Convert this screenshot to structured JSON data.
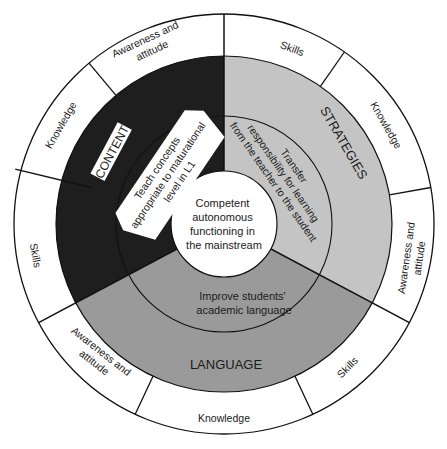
{
  "diagram": {
    "center": {
      "label_lines": [
        "Competent",
        "autonomous",
        "functioning in",
        "the mainstream"
      ]
    },
    "sectors": [
      {
        "id": "content",
        "title": "CONTENT",
        "fill": "#1e1e1e",
        "goal_lines": [
          "Teach concepts",
          "appropriate to maturational",
          "level in L1"
        ],
        "outer_ring": [
          "Awareness and attitude",
          "Knowledge",
          "Skills"
        ]
      },
      {
        "id": "strategies",
        "title": "STRATEGIES",
        "fill": "#c4c4c4",
        "goal_lines": [
          "Transfer",
          "responsibility for learning",
          "from the teacher to the student"
        ],
        "outer_ring": [
          "Skills",
          "Knowledge",
          "Awareness and attitude"
        ]
      },
      {
        "id": "language",
        "title": "LANGUAGE",
        "fill": "#9a9a9a",
        "goal_lines": [
          "Improve students'",
          "academic language"
        ],
        "outer_ring": [
          "Awareness and attitude",
          "Knowledge",
          "Skills"
        ]
      }
    ],
    "ring_labels": {
      "content_awareness_1": "Awareness and",
      "content_awareness_2": "attitude",
      "content_knowledge": "Knowledge",
      "content_skills": "Skills",
      "strategies_skills": "Skills",
      "strategies_knowledge": "Knowledge",
      "strategies_awareness_1": "Awareness and",
      "strategies_awareness_2": "attitude",
      "language_awareness_1": "Awareness and",
      "language_awareness_2": "attitude",
      "language_knowledge": "Knowledge",
      "language_skills": "Skills"
    },
    "colors": {
      "content": "#1e1e1e",
      "strategies": "#c4c4c4",
      "language": "#9a9a9a",
      "outer_ring": "#ffffff",
      "line": "#111111"
    }
  }
}
